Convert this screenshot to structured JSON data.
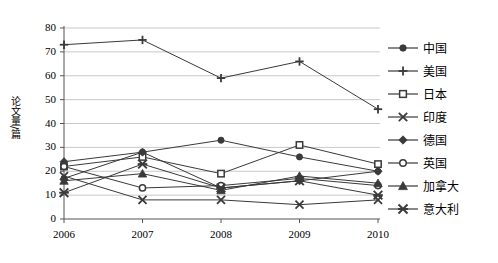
{
  "chart_data": {
    "type": "line",
    "title": "",
    "xlabel": "",
    "ylabel": "论文量/篇",
    "categories": [
      "2006",
      "2007",
      "2008",
      "2009",
      "2010"
    ],
    "x": [
      2006,
      2007,
      2008,
      2009,
      2010
    ],
    "ylim": [
      0,
      80
    ],
    "ytick_step": 10,
    "yticks": [
      "0",
      "10",
      "20",
      "30",
      "40",
      "50",
      "60",
      "70",
      "80"
    ],
    "grid": true,
    "legend_position": "right",
    "series": [
      {
        "name": "中国",
        "marker": "filled-circle",
        "values": [
          17,
          28,
          33,
          26,
          20
        ]
      },
      {
        "name": "美国",
        "marker": "plus",
        "values": [
          73,
          75,
          59,
          66,
          46
        ]
      },
      {
        "name": "日本",
        "marker": "open-square",
        "values": [
          22,
          26,
          19,
          31,
          23
        ]
      },
      {
        "name": "印度",
        "marker": "cross-x",
        "values": [
          18,
          8,
          8,
          6,
          8
        ]
      },
      {
        "name": "德国",
        "marker": "filled-diamond",
        "values": [
          24,
          28,
          13,
          16,
          20
        ]
      },
      {
        "name": "英国",
        "marker": "open-circle",
        "values": [
          22,
          13,
          14,
          17,
          14
        ]
      },
      {
        "name": "加拿大",
        "marker": "filled-triangle",
        "values": [
          16,
          19,
          12,
          18,
          15
        ]
      },
      {
        "name": "意大利",
        "marker": "star-x",
        "values": [
          11,
          23,
          13,
          16,
          10
        ]
      }
    ]
  },
  "axis": {
    "y_label": "论文量/篇"
  },
  "colors": {
    "line": "#3a3a3a",
    "grid": "#c8c8c8",
    "axis": "#555555",
    "text": "#000000",
    "background": "#ffffff"
  }
}
